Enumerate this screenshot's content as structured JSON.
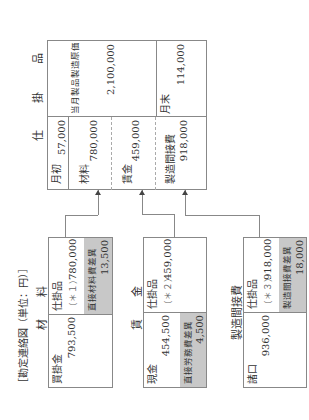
{
  "diagram_title": "［勘定連絡図（単位：円）］",
  "wip": {
    "title": "仕 掛 品",
    "debit": [
      {
        "label": "月初",
        "amount": "57,000"
      },
      {
        "label": "材料",
        "amount": "780,000"
      },
      {
        "label": "賃金",
        "amount": "459,000"
      },
      {
        "label": "製造間接費",
        "amount": "918,000"
      }
    ],
    "credit": [
      {
        "label": "当月製品製造原価",
        "amount": "2,100,000"
      },
      {
        "label": "月末",
        "amount": "114,000"
      }
    ]
  },
  "material": {
    "title": "材　　料",
    "debit": {
      "label": "買掛金",
      "amount": "793,500"
    },
    "credit": {
      "label": "仕掛品",
      "note": "（＊１）",
      "amount": "780,000"
    },
    "variance": {
      "label": "直接材料費差異",
      "amount": "13,500",
      "side": "credit"
    }
  },
  "labor": {
    "title": "賃　　金",
    "debit": {
      "label": "現金",
      "amount": "454,500"
    },
    "credit": {
      "label": "仕掛品",
      "note": "（＊２）",
      "amount": "459,000"
    },
    "variance": {
      "label": "直接労務費差異",
      "amount": "4,500",
      "side": "debit"
    }
  },
  "overhead": {
    "title": "製造間接費",
    "debit": {
      "label": "諸口",
      "amount": "936,000"
    },
    "credit": {
      "label": "仕掛品",
      "note": "（＊３）",
      "amount": "918,000"
    },
    "variance": {
      "label": "製造間接費差異",
      "amount": "18,000",
      "side": "credit"
    }
  },
  "colors": {
    "line": "#888888",
    "shade": "#c8c8c8",
    "text": "#333333"
  }
}
